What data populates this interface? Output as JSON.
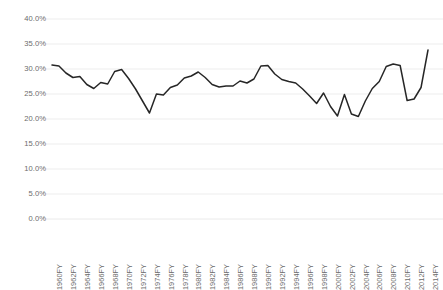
{
  "chart_data": {
    "type": "line",
    "title": "",
    "subtitle": "",
    "xlabel": "",
    "ylabel": "",
    "ylim": [
      0,
      40
    ],
    "ytick_values": [
      0,
      5,
      10,
      15,
      20,
      25,
      30,
      35,
      40
    ],
    "ytick_labels": [
      "0.0%",
      "5.0%",
      "10.0%",
      "15.0%",
      "20.0%",
      "25.0%",
      "30.0%",
      "35.0%",
      "40.0%"
    ],
    "grid": true,
    "grid_axis": "y",
    "legend": false,
    "legend_position": "none",
    "line_color": "#262626",
    "grid_color": "#e8e8e8",
    "text_color": "#6b6b6b",
    "background": "#ffffff",
    "xtick_labels": [
      "1960FY",
      "1962FY",
      "1964FY",
      "1966FY",
      "1968FY",
      "1970FY",
      "1972FY",
      "1974FY",
      "1976FY",
      "1978FY",
      "1980FY",
      "1982FY",
      "1984FY",
      "1986FY",
      "1988FY",
      "1990FY",
      "1992FY",
      "1994FY",
      "1996FY",
      "1998FY",
      "2000FY",
      "2002FY",
      "2004FY",
      "2006FY",
      "2008FY",
      "2010FY",
      "2012FY",
      "2014FY"
    ],
    "xtick_interval": 2,
    "categories": [
      "1960FY",
      "1961FY",
      "1962FY",
      "1963FY",
      "1964FY",
      "1965FY",
      "1966FY",
      "1967FY",
      "1968FY",
      "1969FY",
      "1970FY",
      "1971FY",
      "1972FY",
      "1973FY",
      "1974FY",
      "1975FY",
      "1976FY",
      "1977FY",
      "1978FY",
      "1979FY",
      "1980FY",
      "1981FY",
      "1982FY",
      "1983FY",
      "1984FY",
      "1985FY",
      "1986FY",
      "1987FY",
      "1988FY",
      "1989FY",
      "1990FY",
      "1991FY",
      "1992FY",
      "1993FY",
      "1994FY",
      "1995FY",
      "1996FY",
      "1997FY",
      "1998FY",
      "1999FY",
      "2000FY",
      "2001FY",
      "2002FY",
      "2003FY",
      "2004FY",
      "2005FY",
      "2006FY",
      "2007FY",
      "2008FY",
      "2009FY",
      "2010FY",
      "2011FY",
      "2012FY",
      "2013FY",
      "2014FY"
    ],
    "values": [
      30.8,
      30.6,
      29.2,
      28.3,
      28.5,
      26.9,
      26.1,
      27.3,
      27.0,
      29.5,
      29.9,
      28.1,
      26.0,
      23.6,
      21.2,
      25.0,
      24.8,
      26.3,
      26.8,
      28.2,
      28.6,
      29.4,
      28.3,
      26.9,
      26.4,
      26.6,
      26.6,
      27.6,
      27.2,
      28.0,
      30.6,
      30.7,
      29.0,
      27.9,
      27.5,
      27.2,
      26.0,
      24.6,
      23.1,
      25.2,
      22.5,
      20.6,
      24.9,
      21.0,
      20.5,
      23.6,
      26.1,
      27.5,
      30.5,
      31.0,
      30.7,
      23.7,
      24.0,
      26.3,
      33.8
    ]
  }
}
